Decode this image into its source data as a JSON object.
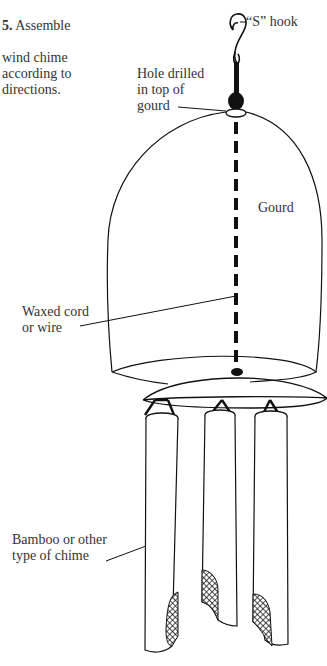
{
  "instruction": {
    "step_number": "5.",
    "text_line1": " Assemble",
    "text_rest": "wind chime\naccording to\ndirections."
  },
  "labels": {
    "s_hook": "“S” hook",
    "hole": "Hole drilled\nin top of\ngourd",
    "gourd": "Gourd",
    "cord": "Waxed cord\nor wire",
    "chime": "Bamboo or other\ntype of chime"
  },
  "colors": {
    "ink": "#111111",
    "text": "#333333",
    "background": "#ffffff"
  },
  "diagram": {
    "parts": [
      "s-hook",
      "knot-bead",
      "drilled-hole",
      "gourd-body",
      "waxed-cord",
      "gourd-rim",
      "disc",
      "chime-tube-left",
      "chime-tube-center",
      "chime-tube-right"
    ],
    "chime_count": 3
  }
}
